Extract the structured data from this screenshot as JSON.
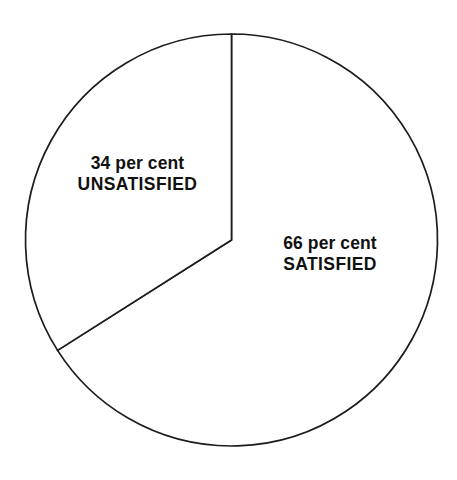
{
  "chart_data": {
    "type": "pie",
    "title": "",
    "subtitle": "",
    "xlabel": "",
    "ylabel": "",
    "grid": false,
    "legend": "none",
    "labels_position": "inside-slice",
    "units": "per cent",
    "start_angle_deg": 0,
    "direction": "clockwise",
    "categories": [
      "SATISFIED",
      "UNSATISFIED"
    ],
    "values": [
      66,
      34
    ],
    "slices": [
      {
        "name": "SATISFIED",
        "value": 66,
        "value_text": "66 per cent",
        "label_text": "SATISFIED",
        "angle_deg": 237.6,
        "fill": "#ffffff",
        "stroke": "#1c1c1c"
      },
      {
        "name": "UNSATISFIED",
        "value": 34,
        "value_text": "34 per cent",
        "label_text": "UNSATISFIED",
        "angle_deg": 122.4,
        "fill": "#ffffff",
        "stroke": "#1c1c1c"
      }
    ]
  },
  "chart": {
    "background": "#ffffff",
    "outline_color": "#1c1c1c",
    "center_x": 231.5,
    "center_y": 240,
    "radius": 206
  },
  "labels": {
    "unsatisfied": {
      "value": "34 per cent",
      "name": "UNSATISFIED"
    },
    "satisfied": {
      "value": "66 per cent",
      "name": "SATISFIED"
    }
  }
}
